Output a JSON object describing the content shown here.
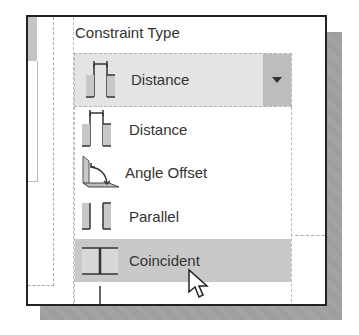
{
  "panel": {
    "title": "Constraint Type"
  },
  "combo": {
    "selected_label": "Distance",
    "selected_icon": "distance-constraint-icon",
    "dropdown_icon": "dropdown-arrow-icon"
  },
  "list": {
    "items": [
      {
        "label": "Distance",
        "icon": "distance-constraint-icon",
        "highlighted": false
      },
      {
        "label": "Angle Offset",
        "icon": "angle-offset-constraint-icon",
        "highlighted": false
      },
      {
        "label": "Parallel",
        "icon": "parallel-constraint-icon",
        "highlighted": false
      },
      {
        "label": "Coincident",
        "icon": "coincident-constraint-icon",
        "highlighted": true
      }
    ]
  },
  "colors": {
    "highlight": "#c9c9c9",
    "combo_bg": "#e4e4e4",
    "border": "#222222"
  }
}
